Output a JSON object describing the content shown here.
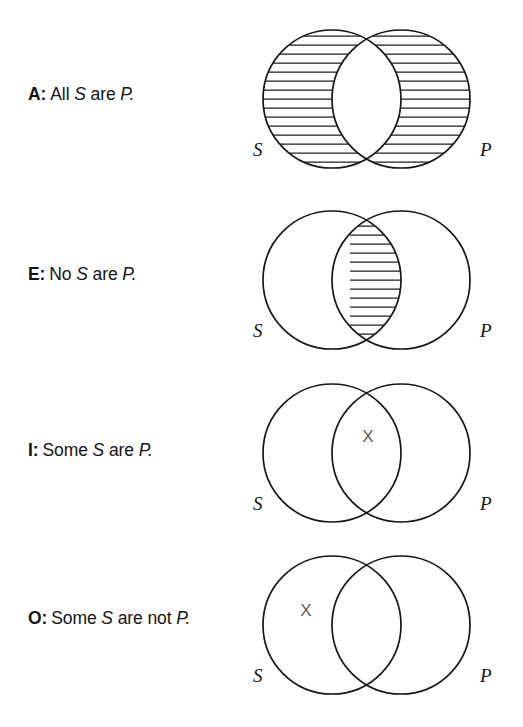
{
  "figure": {
    "background_color": "#ffffff",
    "ink_color": "#161616",
    "x_mark_color": "#5a5a5a",
    "set_label_s": "S",
    "set_label_p": "P",
    "x_mark_glyph": "X"
  },
  "propositions": [
    {
      "letter": "A:",
      "words_1": "All",
      "subject": "S",
      "words_2": "are",
      "predicate": "P.",
      "full_text": "A: All S are P.",
      "shaded_region": "S-not-P",
      "x_region": null,
      "labels": {
        "left": "S",
        "right": "P"
      }
    },
    {
      "letter": "E:",
      "words_1": "No",
      "subject": "S",
      "words_2": "are",
      "predicate": "P.",
      "full_text": "E: No S are P.",
      "shaded_region": "S-and-P",
      "x_region": null,
      "labels": {
        "left": "S",
        "right": "P"
      }
    },
    {
      "letter": "I:",
      "words_1": "Some",
      "subject": "S",
      "words_2": "are",
      "predicate": "P.",
      "full_text": "I: Some S are P.",
      "shaded_region": null,
      "x_region": "S-and-P",
      "labels": {
        "left": "S",
        "right": "P"
      }
    },
    {
      "letter": "O:",
      "words_1": "Some",
      "subject": "S",
      "words_2": "are not",
      "predicate": "P.",
      "full_text": "O: Some S are not P.",
      "shaded_region": null,
      "x_region": "S-not-P",
      "labels": {
        "left": "S",
        "right": "P"
      }
    }
  ]
}
